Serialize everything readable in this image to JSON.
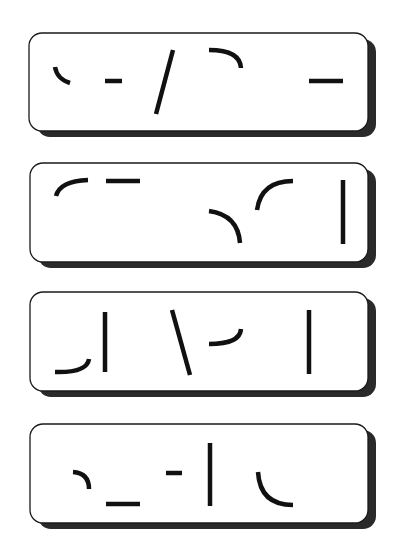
{
  "figure": {
    "colors": {
      "background": "#ffffff",
      "card_fill": "#ffffff",
      "card_border": "#1a1a1a",
      "shadow": "#2a2a2a",
      "stroke": "#111111"
    },
    "stroke_width": 4.5,
    "card_radius": 13,
    "shadow_offset": [
      8,
      6
    ]
  },
  "panels": [
    {
      "id": "panel-1",
      "box": {
        "x": 29,
        "y": 33,
        "w": 339,
        "h": 98
      },
      "strokes": [
        {
          "type": "path",
          "d": "M 55 67 Q 57 79 70 83"
        },
        {
          "type": "line",
          "x1": 105,
          "y1": 81,
          "x2": 122,
          "y2": 81
        },
        {
          "type": "line",
          "x1": 173,
          "y1": 50,
          "x2": 156,
          "y2": 114
        },
        {
          "type": "path",
          "d": "M 209 50 Q 240 50 241 68"
        },
        {
          "type": "line",
          "x1": 309,
          "y1": 81,
          "x2": 343,
          "y2": 81
        }
      ]
    },
    {
      "id": "panel-2",
      "box": {
        "x": 30,
        "y": 163,
        "w": 338,
        "h": 99
      },
      "strokes": [
        {
          "type": "path",
          "d": "M 56 196 Q 60 181 88 180"
        },
        {
          "type": "line",
          "x1": 106,
          "y1": 181,
          "x2": 140,
          "y2": 181
        },
        {
          "type": "path",
          "d": "M 209 211 Q 238 215 240 243"
        },
        {
          "type": "path",
          "d": "M 257 210 Q 261 181 293 181"
        },
        {
          "type": "line",
          "x1": 343,
          "y1": 180,
          "x2": 343,
          "y2": 244
        }
      ]
    },
    {
      "id": "panel-3",
      "box": {
        "x": 30,
        "y": 292,
        "w": 338,
        "h": 99
      },
      "strokes": [
        {
          "type": "path",
          "d": "M 55 372 Q 87 373 89 359"
        },
        {
          "type": "line",
          "x1": 105,
          "y1": 312,
          "x2": 105,
          "y2": 372
        },
        {
          "type": "line",
          "x1": 172,
          "y1": 310,
          "x2": 190,
          "y2": 375
        },
        {
          "type": "path",
          "d": "M 209 344 Q 240 344 241 329"
        },
        {
          "type": "line",
          "x1": 309,
          "y1": 310,
          "x2": 309,
          "y2": 374
        }
      ]
    },
    {
      "id": "panel-4",
      "box": {
        "x": 30,
        "y": 424,
        "w": 338,
        "h": 99
      },
      "strokes": [
        {
          "type": "path",
          "d": "M 73 472 Q 89 473 89 489"
        },
        {
          "type": "line",
          "x1": 106,
          "y1": 504,
          "x2": 140,
          "y2": 504
        },
        {
          "type": "line",
          "x1": 166,
          "y1": 473,
          "x2": 182,
          "y2": 473
        },
        {
          "type": "line",
          "x1": 210,
          "y1": 443,
          "x2": 210,
          "y2": 506
        },
        {
          "type": "path",
          "d": "M 258 472 Q 260 505 293 505"
        }
      ]
    }
  ]
}
